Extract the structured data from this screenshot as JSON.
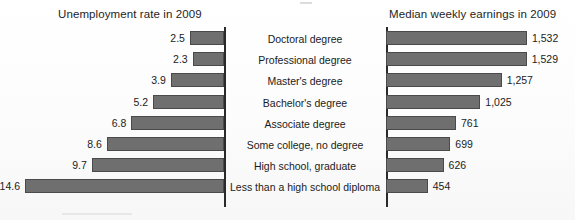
{
  "figure": {
    "left_title": "Unemployment rate in 2009",
    "right_title": "Median weekly earnings in 2009"
  },
  "chart_data": {
    "type": "bar",
    "title": "",
    "orientation": "horizontal",
    "layout": "paired back-to-back (tornado) bar chart; left axis inverted",
    "grid": false,
    "legend": false,
    "categories": [
      "Doctoral degree",
      "Professional degree",
      "Master's degree",
      "Bachelor's degree",
      "Associate degree",
      "Some college, no degree",
      "High school, graduate",
      "Less than a high school diploma"
    ],
    "series": [
      {
        "name": "Unemployment rate in 2009",
        "side": "left",
        "unit": "percent",
        "xlabel": "",
        "ylabel": "",
        "xlim": [
          0,
          14.6
        ],
        "values": [
          2.5,
          2.3,
          3.9,
          5.2,
          6.8,
          8.6,
          9.7,
          14.6
        ],
        "labels": [
          "2.5",
          "2.3",
          "3.9",
          "5.2",
          "6.8",
          "8.6",
          "9.7",
          "14.6"
        ]
      },
      {
        "name": "Median weekly earnings in 2009",
        "side": "right",
        "unit": "US dollars",
        "xlabel": "",
        "ylabel": "",
        "xlim": [
          0,
          1532
        ],
        "values": [
          1532,
          1529,
          1257,
          1025,
          761,
          699,
          626,
          454
        ],
        "labels": [
          "1,532",
          "1,529",
          "1,257",
          "1,025",
          "761",
          "699",
          "626",
          "454"
        ]
      }
    ]
  },
  "colors": {
    "bar_fill": "#6f6f6f",
    "bar_stroke": "#4a4a4a",
    "axis": "#2a2a2a",
    "text": "#1b1b1b",
    "background": "#fdfdfd"
  }
}
